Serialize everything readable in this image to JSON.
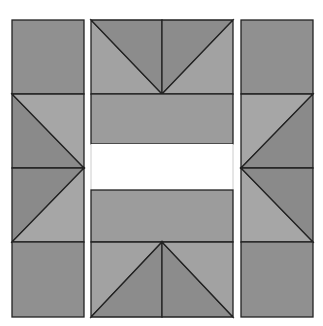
{
  "diagram": {
    "colors": {
      "background": "#ffffff",
      "dark": "#8c8c8c",
      "medium": "#9a9a9a",
      "light": "#a8a8a8",
      "outline": "#222222",
      "gap": "#ffffff"
    },
    "columns": [
      {
        "name": "left-column",
        "x": 12,
        "w": 72
      },
      {
        "name": "middle-column",
        "x": 91,
        "w": 142
      },
      {
        "name": "right-column",
        "x": 241,
        "w": 72
      }
    ],
    "rows": {
      "top": 20,
      "r1": 94,
      "r2": 144,
      "r3": 190,
      "r4": 242,
      "bottom": 317,
      "mid": 168
    }
  }
}
